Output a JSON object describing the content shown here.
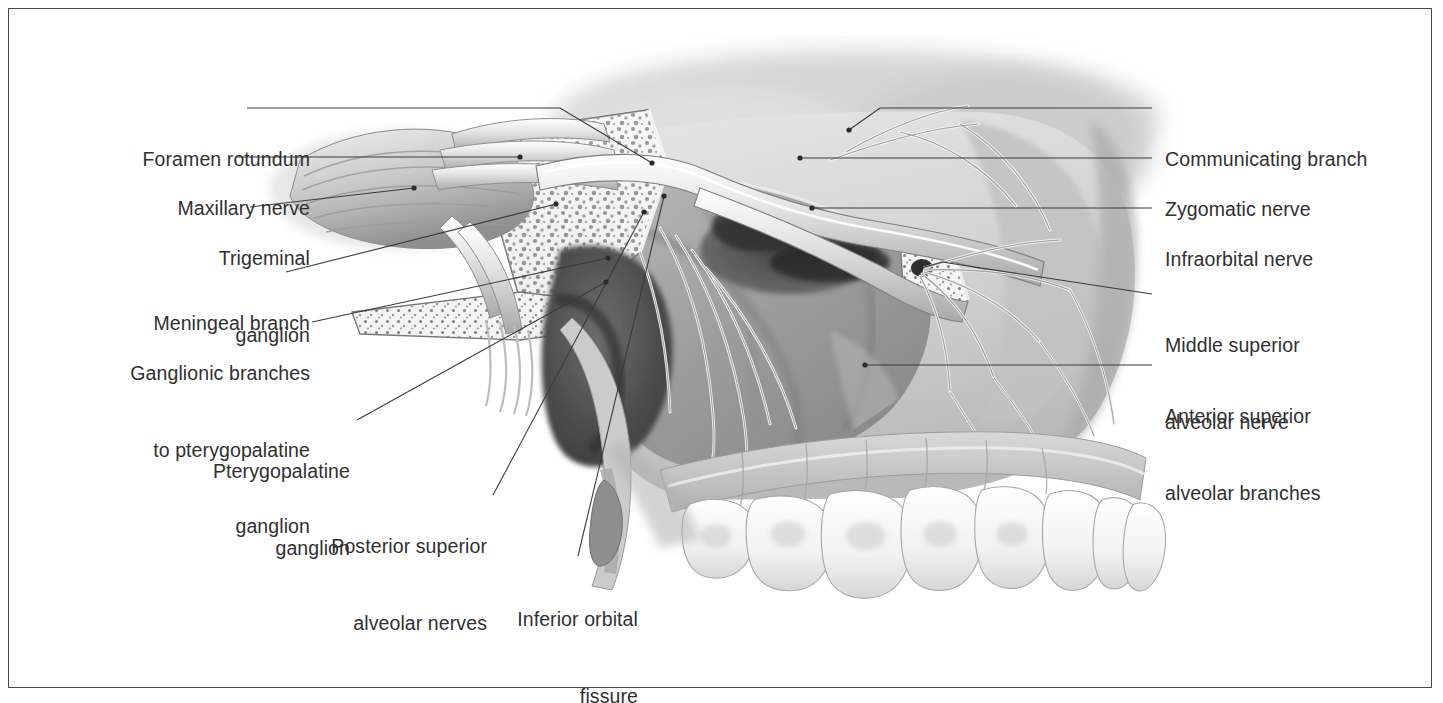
{
  "figure": {
    "kind": "anatomical-illustration",
    "style": "grayscale airbrush medical atlas plate",
    "border_color": "#4a4a4a",
    "label_color": "#303030",
    "leader_color": "#3a3a3a",
    "background": "#ffffff"
  },
  "labels_left": [
    {
      "id": "foramen-rotundum",
      "text": "Foramen rotundum",
      "lines": [
        "Foramen rotundum"
      ]
    },
    {
      "id": "maxillary-nerve",
      "text": "Maxillary nerve",
      "lines": [
        "Maxillary nerve"
      ]
    },
    {
      "id": "trigeminal-ganglion",
      "text": "Trigeminal ganglion",
      "lines": [
        "Trigeminal",
        "ganglion"
      ]
    },
    {
      "id": "meningeal-branch",
      "text": "Meningeal branch",
      "lines": [
        "Meningeal branch"
      ]
    },
    {
      "id": "ganglionic-branches",
      "text": "Ganglionic branches to pterygopalatine ganglion",
      "lines": [
        "Ganglionic branches",
        "to pterygopalatine",
        "ganglion"
      ]
    },
    {
      "id": "pterygopalatine-ganglion",
      "text": "Pterygopalatine ganglion",
      "lines": [
        "Pterygopalatine",
        "ganglion"
      ]
    },
    {
      "id": "posterior-superior-alveolar-nerves",
      "text": "Posterior superior alveolar nerves",
      "lines": [
        "Posterior superior",
        "alveolar nerves"
      ]
    },
    {
      "id": "inferior-orbital-fissure",
      "text": "Inferior orbital fissure",
      "lines": [
        "Inferior orbital",
        "fissure"
      ]
    }
  ],
  "labels_right": [
    {
      "id": "communicating-branch",
      "text": "Communicating branch",
      "lines": [
        "Communicating branch"
      ]
    },
    {
      "id": "zygomatic-nerve",
      "text": "Zygomatic nerve",
      "lines": [
        "Zygomatic nerve"
      ]
    },
    {
      "id": "infraorbital-nerve",
      "text": "Infraorbital nerve",
      "lines": [
        "Infraorbital nerve"
      ]
    },
    {
      "id": "middle-superior-alveolar-nerve",
      "text": "Middle superior alveolar nerve",
      "lines": [
        "Middle superior",
        "alveolar nerve"
      ]
    },
    {
      "id": "anterior-superior-alveolar-branches",
      "text": "Anterior superior alveolar branches",
      "lines": [
        "Anterior superior",
        "alveolar branches"
      ]
    }
  ]
}
